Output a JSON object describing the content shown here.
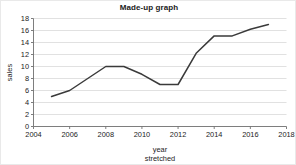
{
  "chart_data": {
    "type": "line",
    "title": "Made-up graph",
    "xlabel": "year",
    "xlabel_second_line": "stretched",
    "ylabel": "sales",
    "xlim": [
      2004,
      2018
    ],
    "ylim": [
      0,
      18
    ],
    "xticks": [
      2004,
      2006,
      2008,
      2010,
      2012,
      2014,
      2016,
      2018
    ],
    "yticks": [
      0,
      2,
      4,
      6,
      8,
      10,
      12,
      14,
      16,
      18
    ],
    "grid": "horizontal",
    "legend": "none",
    "line_color": "#3a3a3a",
    "grid_color": "#d4d4d4",
    "axis_color": "#6f6f6f",
    "series": [
      {
        "name": "sales",
        "x": [
          2005,
          2006,
          2007,
          2008,
          2009,
          2010,
          2011,
          2012,
          2013,
          2014,
          2015,
          2016,
          2017
        ],
        "values": [
          5.0,
          6.0,
          8.0,
          10.0,
          10.0,
          8.7,
          7.0,
          7.0,
          12.2,
          15.1,
          15.1,
          16.2,
          17.0
        ]
      }
    ]
  }
}
